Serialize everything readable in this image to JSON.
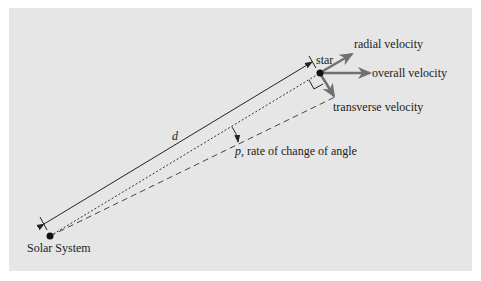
{
  "labels": {
    "star": "star",
    "solar_system": "Solar System",
    "radial_velocity": "radial velocity",
    "overall_velocity": "overall velocity",
    "transverse_velocity": "transverse velocity",
    "distance_symbol": "d",
    "angle_symbol": "p",
    "angle_description": ", rate of change of angle"
  },
  "colors": {
    "background": "#e6e6e6",
    "velocity_arrows": "#707070",
    "lines": "#222222"
  }
}
